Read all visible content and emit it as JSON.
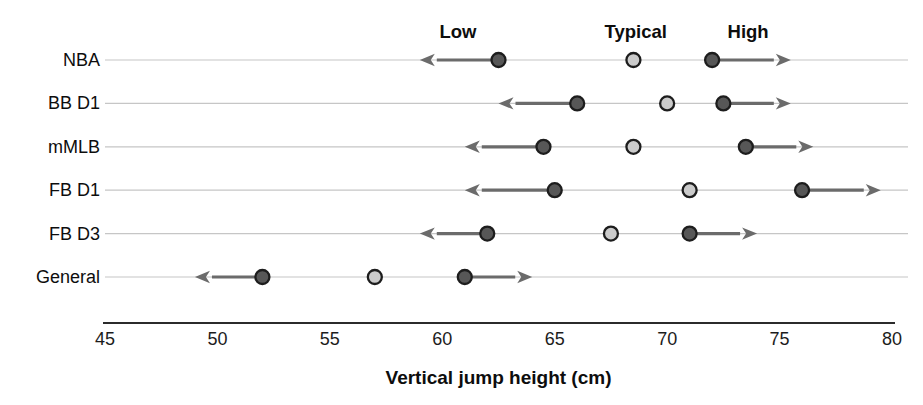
{
  "chart_data": {
    "type": "scatter",
    "subtype": "dot-range-plot",
    "title": "",
    "xlabel": "Vertical jump height (cm)",
    "ylabel": "",
    "xlim": [
      45,
      80
    ],
    "xticks": [
      45,
      50,
      55,
      60,
      65,
      70,
      75,
      80
    ],
    "grid": "horizontal-row-lines",
    "legend_position": "none",
    "column_headers": [
      {
        "label": "Low",
        "x": 60.7
      },
      {
        "label": "Typical",
        "x": 68.6
      },
      {
        "label": "High",
        "x": 73.6
      }
    ],
    "categories": [
      "NBA",
      "BB D1",
      "mMLB",
      "FB D1",
      "FB D3",
      "General"
    ],
    "rows": [
      {
        "category": "NBA",
        "arrow_left_tip": 59,
        "low": 62.5,
        "typical": 68.5,
        "high": 72,
        "arrow_right_tip": 75.5
      },
      {
        "category": "BB D1",
        "arrow_left_tip": 62.5,
        "low": 66,
        "typical": 70,
        "high": 72.5,
        "arrow_right_tip": 75.5
      },
      {
        "category": "mMLB",
        "arrow_left_tip": 61,
        "low": 64.5,
        "typical": 68.5,
        "high": 73.5,
        "arrow_right_tip": 76.5
      },
      {
        "category": "FB D1",
        "arrow_left_tip": 61,
        "low": 65,
        "typical": 71,
        "high": 76,
        "arrow_right_tip": 79.5
      },
      {
        "category": "FB D3",
        "arrow_left_tip": 59,
        "low": 62,
        "typical": 67.5,
        "high": 71,
        "arrow_right_tip": 74
      },
      {
        "category": "General",
        "arrow_left_tip": 49,
        "low": 52,
        "typical": 57,
        "high": 61,
        "arrow_right_tip": 64
      }
    ],
    "colors": {
      "low_high_dot_fill": "#575757",
      "typical_dot_fill": "#cbcbcb",
      "dot_border": "#1d1d1d",
      "arrow": "#6b6b6b",
      "gridline": "#c6c6c6",
      "axis_line": "#2b2b2b",
      "text": "#0d0d0d",
      "background": "#ffffff"
    }
  }
}
